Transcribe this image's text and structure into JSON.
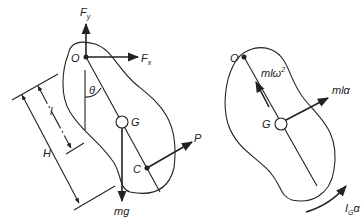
{
  "diagram": {
    "left_panel": {
      "name": "free-body-diagram",
      "labels": {
        "pivot": "O",
        "center_of_mass": "G",
        "point_c": "C",
        "angle": "θ",
        "force_x": "F",
        "force_x_sub": "x",
        "force_y": "F",
        "force_y_sub": "y",
        "applied_force": "P",
        "weight": "mg",
        "dim_l": "l",
        "dim_H": "H"
      }
    },
    "right_panel": {
      "name": "kinetic-diagram",
      "labels": {
        "pivot": "O",
        "center_of_mass": "G",
        "centripetal": "mlω",
        "centripetal_sup": "2",
        "tangential": "mlα",
        "moment": "I",
        "moment_sub": "G",
        "moment_suffix": "α"
      }
    },
    "colors": {
      "ink": "#222222",
      "background": "#ffffff"
    }
  }
}
